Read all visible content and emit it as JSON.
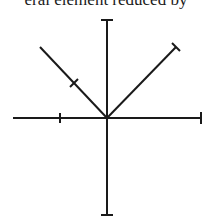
{
  "caption": "eral element reduced by",
  "diagram": {
    "stroke_color": "#1a1a1a",
    "center": [
      107,
      118
    ],
    "axes": {
      "vertical": {
        "top": [
          107,
          20
        ],
        "bottom": [
          107,
          215
        ]
      },
      "horizontal": {
        "left": [
          13,
          118
        ],
        "right": [
          201,
          118
        ]
      }
    },
    "diagonals": {
      "left": {
        "start": [
          40,
          47
        ],
        "end": [
          107,
          118
        ],
        "tick": [
          74,
          83
        ]
      },
      "right": {
        "start": [
          176,
          47
        ],
        "end": [
          107,
          118
        ],
        "cap": [
          176,
          47
        ]
      }
    },
    "ticks": {
      "horizontal_left_tick": [
        60,
        118
      ]
    }
  }
}
